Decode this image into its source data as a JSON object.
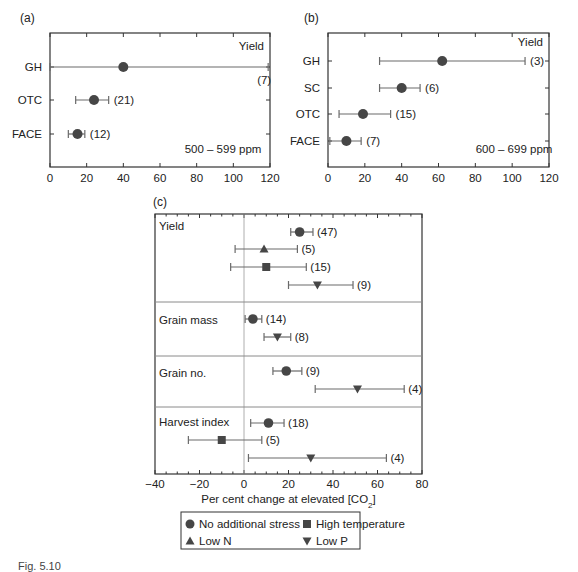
{
  "chart_data": [
    {
      "id": "a",
      "panel_label": "(a)",
      "type": "scatter",
      "subtype": "forest-plot",
      "title": "Yield",
      "annotation": "500 – 599 ppm",
      "xlabel": "",
      "xlim": [
        0,
        120
      ],
      "xticks": [
        0,
        20,
        40,
        60,
        80,
        100,
        120
      ],
      "categories": [
        "GH",
        "OTC",
        "FACE"
      ],
      "series": [
        {
          "name": "No additional stress",
          "marker": "circle",
          "points": [
            {
              "category": "GH",
              "value": 40,
              "ci": [
                0,
                119
              ],
              "n": "(7)"
            },
            {
              "category": "OTC",
              "value": 24,
              "ci": [
                14,
                32
              ],
              "n": "(21)"
            },
            {
              "category": "FACE",
              "value": 15,
              "ci": [
                10,
                19
              ],
              "n": "(12)"
            }
          ]
        }
      ]
    },
    {
      "id": "b",
      "panel_label": "(b)",
      "type": "scatter",
      "subtype": "forest-plot",
      "title": "Yield",
      "annotation": "600 – 699 ppm",
      "xlabel": "",
      "xlim": [
        0,
        120
      ],
      "xticks": [
        0,
        20,
        40,
        60,
        80,
        100,
        120
      ],
      "categories": [
        "GH",
        "SC",
        "OTC",
        "FACE"
      ],
      "series": [
        {
          "name": "No additional stress",
          "marker": "circle",
          "points": [
            {
              "category": "GH",
              "value": 62,
              "ci": [
                28,
                107
              ],
              "n": "(3)"
            },
            {
              "category": "SC",
              "value": 40,
              "ci": [
                28,
                50
              ],
              "n": "(6)"
            },
            {
              "category": "OTC",
              "value": 19,
              "ci": [
                6,
                34
              ],
              "n": "(15)"
            },
            {
              "category": "FACE",
              "value": 10,
              "ci": [
                1,
                18
              ],
              "n": "(7)"
            }
          ]
        }
      ]
    },
    {
      "id": "c",
      "panel_label": "(c)",
      "type": "scatter",
      "subtype": "forest-plot",
      "xlabel": "Per cent change at elevated [CO",
      "xlabel_sub": "2",
      "xlabel_end": "]",
      "xlim": [
        -40,
        80
      ],
      "xticks": [
        -40,
        -20,
        0,
        20,
        40,
        60,
        80
      ],
      "xtick_labels": [
        "−40",
        "−20",
        "0",
        "20",
        "40",
        "60",
        "80"
      ],
      "reference_line": 0,
      "groups": [
        {
          "label": "Yield",
          "rows": [
            {
              "series": "No additional stress",
              "marker": "circle",
              "value": 25,
              "ci": [
                21,
                31
              ],
              "n": "(47)"
            },
            {
              "series": "Low N",
              "marker": "triangle-up",
              "value": 9,
              "ci": [
                -4,
                24
              ],
              "n": "(5)"
            },
            {
              "series": "High temperature",
              "marker": "square",
              "value": 10,
              "ci": [
                -6,
                28
              ],
              "n": "(15)"
            },
            {
              "series": "Low P",
              "marker": "triangle-down",
              "value": 33,
              "ci": [
                20,
                49
              ],
              "n": "(9)"
            }
          ]
        },
        {
          "label": "Grain mass",
          "rows": [
            {
              "series": "No additional stress",
              "marker": "circle",
              "value": 4,
              "ci": [
                0.5,
                8
              ],
              "n": "(14)"
            },
            {
              "series": "Low P",
              "marker": "triangle-down",
              "value": 15,
              "ci": [
                9,
                21
              ],
              "n": "(8)"
            }
          ]
        },
        {
          "label": "Grain no.",
          "rows": [
            {
              "series": "No additional stress",
              "marker": "circle",
              "value": 19,
              "ci": [
                13,
                26
              ],
              "n": "(9)"
            },
            {
              "series": "Low P",
              "marker": "triangle-down",
              "value": 51,
              "ci": [
                32,
                72
              ],
              "n": "(4)"
            }
          ]
        },
        {
          "label": "Harvest index",
          "rows": [
            {
              "series": "No additional stress",
              "marker": "circle",
              "value": 11,
              "ci": [
                3,
                18
              ],
              "n": "(18)"
            },
            {
              "series": "High temperature",
              "marker": "square",
              "value": -10,
              "ci": [
                -25,
                8
              ],
              "n": "(5)"
            },
            {
              "series": "Low P",
              "marker": "triangle-down",
              "value": 30,
              "ci": [
                2,
                64
              ],
              "n": "(4)"
            }
          ]
        }
      ],
      "legend": {
        "position": "below",
        "entries": [
          {
            "marker": "circle",
            "label": "No additional stress"
          },
          {
            "marker": "square",
            "label": "High temperature"
          },
          {
            "marker": "triangle-up",
            "label": "Low N"
          },
          {
            "marker": "triangle-down",
            "label": "Low P"
          }
        ]
      }
    }
  ],
  "colors": {
    "marker": "#464646",
    "whisker": "#6a6a6a",
    "axis": "#333333",
    "separator": "#8a8a8a",
    "refline": "#9a9a9a"
  },
  "caption": "Fig. 5.10"
}
